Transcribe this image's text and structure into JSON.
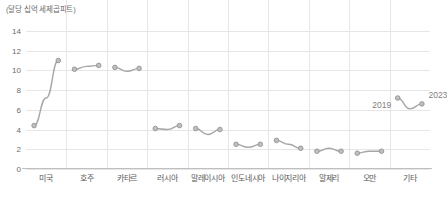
{
  "axis_unit_title": "(달당 십억 세제곱피트)",
  "footer_note": "",
  "colors": {
    "line": "#a6a6a6",
    "marker_fill": "#bfbfbf",
    "marker_stroke": "#8c8c8c",
    "grid": "#e6e6e6",
    "axis": "#bfbfbf",
    "text": "#5a5a5a",
    "annotation": "#7f7f7f"
  },
  "annotations": [
    {
      "text": "2019",
      "group_index": 9,
      "point_index": 0
    },
    {
      "text": "2023",
      "group_index": 9,
      "point_index": 1
    }
  ],
  "chart_data": {
    "type": "line",
    "title": "",
    "subtitle": "",
    "xlabel": "",
    "ylabel": "(달당 십억 세제곱피트)",
    "ylim": [
      0,
      15
    ],
    "yticks": [
      0,
      2,
      4,
      6,
      8,
      10,
      12,
      14
    ],
    "grid": true,
    "legend": "none",
    "x_tick_labels_per_group": [
      "2019",
      "2021",
      "2023"
    ],
    "categories": [
      "미국",
      "호주",
      "카타르",
      "러시아",
      "말레이시아",
      "인도네시아",
      "나이지리아",
      "알제리",
      "오만",
      "기타"
    ],
    "groups": [
      {
        "category": "미국",
        "values": [
          4.4,
          7.2,
          11.0
        ]
      },
      {
        "category": "호주",
        "values": [
          10.1,
          10.4,
          10.5
        ]
      },
      {
        "category": "카타르",
        "values": [
          10.3,
          9.9,
          10.2
        ]
      },
      {
        "category": "러시아",
        "values": [
          4.1,
          4.0,
          4.4
        ]
      },
      {
        "category": "말레이시아",
        "values": [
          4.1,
          3.5,
          4.0
        ]
      },
      {
        "category": "인도네시아",
        "values": [
          2.5,
          2.2,
          2.5
        ]
      },
      {
        "category": "나이지리아",
        "values": [
          2.9,
          2.5,
          2.1
        ]
      },
      {
        "category": "알제리",
        "values": [
          1.8,
          2.1,
          1.8
        ]
      },
      {
        "category": "오만",
        "values": [
          1.6,
          1.8,
          1.8
        ]
      },
      {
        "category": "기타",
        "values": [
          7.2,
          6.1,
          6.6
        ]
      }
    ]
  }
}
